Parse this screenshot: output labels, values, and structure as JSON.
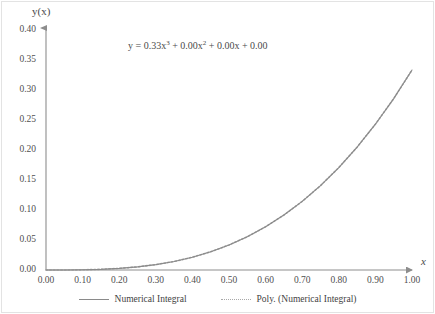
{
  "chart_data": {
    "type": "line",
    "title": "",
    "xlabel": "x",
    "ylabel": "y(x)",
    "xlim": [
      0.0,
      1.0
    ],
    "ylim": [
      0.0,
      0.4
    ],
    "grid": false,
    "legend_position": "bottom",
    "annotation": "y = 0.33x³ + 0.00x² + 0.00x + 0.00",
    "annotation_parts": {
      "lhs": "y = 0.33x",
      "exp1": "3",
      "mid1": " + 0.00x",
      "exp2": "2",
      "tail": " + 0.00x + 0.00"
    },
    "equation_coefficients": {
      "x3": 0.33,
      "x2": 0.0,
      "x1": 0.0,
      "x0": 0.0
    },
    "xticks": [
      "0.00",
      "0.10",
      "0.20",
      "0.30",
      "0.40",
      "0.50",
      "0.60",
      "0.70",
      "0.80",
      "0.90",
      "1.00"
    ],
    "yticks": [
      "0.00",
      "0.05",
      "0.10",
      "0.15",
      "0.20",
      "0.25",
      "0.30",
      "0.35",
      "0.40"
    ],
    "xtick_values": [
      0.0,
      0.1,
      0.2,
      0.3,
      0.4,
      0.5,
      0.6,
      0.7,
      0.8,
      0.9,
      1.0
    ],
    "ytick_values": [
      0.0,
      0.05,
      0.1,
      0.15,
      0.2,
      0.25,
      0.3,
      0.35,
      0.4
    ],
    "series": [
      {
        "name": "Numerical Integral",
        "style": "solid",
        "color": "#8a8a8a",
        "x": [
          0.0,
          0.05,
          0.1,
          0.15,
          0.2,
          0.25,
          0.3,
          0.35,
          0.4,
          0.45,
          0.5,
          0.55,
          0.6,
          0.65,
          0.7,
          0.75,
          0.8,
          0.85,
          0.9,
          0.95,
          1.0
        ],
        "values": [
          0.0,
          0.0,
          0.0003,
          0.0011,
          0.0027,
          0.0052,
          0.009,
          0.0142,
          0.0213,
          0.0304,
          0.0417,
          0.0555,
          0.072,
          0.0916,
          0.1143,
          0.1406,
          0.1707,
          0.2047,
          0.243,
          0.2857,
          0.3333
        ]
      },
      {
        "name": "Poly. (Numerical Integral)",
        "style": "dotted",
        "color": "#a8a8a8",
        "x": [
          0.0,
          0.05,
          0.1,
          0.15,
          0.2,
          0.25,
          0.3,
          0.35,
          0.4,
          0.45,
          0.5,
          0.55,
          0.6,
          0.65,
          0.7,
          0.75,
          0.8,
          0.85,
          0.9,
          0.95,
          1.0
        ],
        "values": [
          0.0,
          0.0,
          0.0003,
          0.0011,
          0.0027,
          0.0052,
          0.009,
          0.0142,
          0.0213,
          0.0304,
          0.0417,
          0.0555,
          0.072,
          0.0916,
          0.1143,
          0.1406,
          0.1707,
          0.2047,
          0.243,
          0.2857,
          0.3333
        ]
      }
    ]
  },
  "legend": {
    "entries": [
      {
        "label": "Numerical Integral"
      },
      {
        "label": "Poly. (Numerical Integral)"
      }
    ]
  },
  "colors": {
    "line": "#8a8a8a",
    "poly_line": "#a8a8a8",
    "axis": "#8d8d8d",
    "text": "#4a4a4a",
    "frame": "#e3e3e3"
  }
}
